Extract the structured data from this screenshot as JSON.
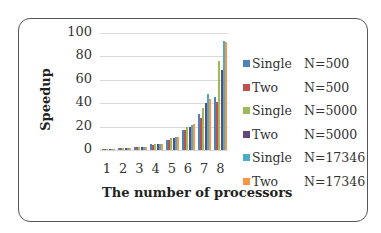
{
  "chart_data": {
    "type": "bar",
    "title": "",
    "xlabel": "The number of processors",
    "ylabel": "Speedup",
    "ylim": [
      0,
      100
    ],
    "yticks": [
      0,
      20,
      40,
      60,
      80,
      100
    ],
    "grid": true,
    "legend_position": "right",
    "categories": [
      "1",
      "2",
      "3",
      "4",
      "5",
      "6",
      "7",
      "8"
    ],
    "series": [
      {
        "name": "Single N=500",
        "label_a": "Single",
        "label_b": "N=500",
        "color": "#4f81bd",
        "values": [
          1,
          1.5,
          2.8,
          4.8,
          8.5,
          17,
          31,
          45
        ]
      },
      {
        "name": "Two N=500",
        "label_a": "Two",
        "label_b": "N=500",
        "color": "#c0504d",
        "values": [
          0.9,
          1.4,
          2.6,
          4.6,
          8.5,
          17,
          27,
          41
        ]
      },
      {
        "name": "Single N=5000",
        "label_a": "Single",
        "label_b": "N=5000",
        "color": "#9bbb59",
        "values": [
          1,
          1.8,
          2.9,
          5,
          10,
          20,
          36,
          76
        ]
      },
      {
        "name": "Two N=5000",
        "label_a": "Two",
        "label_b": "N=5000",
        "color": "#604a7b",
        "values": [
          1,
          1.7,
          2.9,
          5,
          10,
          20,
          40,
          68
        ]
      },
      {
        "name": "Single N=17346",
        "label_a": "Single",
        "label_b": "N=17346",
        "color": "#4bacc6",
        "values": [
          1,
          1.6,
          3,
          5.3,
          11,
          21,
          48,
          93
        ]
      },
      {
        "name": "Two N=17346",
        "label_a": "Two",
        "label_b": "N=17346",
        "color": "#f79646",
        "values": [
          1,
          1.6,
          3,
          5.5,
          11,
          22,
          44,
          92
        ]
      }
    ]
  }
}
